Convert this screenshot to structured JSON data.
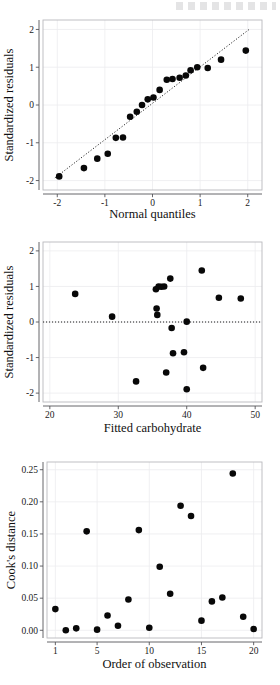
{
  "page": {
    "background": "#ffffff",
    "point_color": "#080808",
    "axis_color": "#555559",
    "grid_color": "#ececef",
    "panel_border_color": "#b9b9bd"
  },
  "chart_data": [
    {
      "id": "qq-plot",
      "type": "scatter",
      "title": "",
      "xlabel": "Normal quantiles",
      "ylabel": "Standardized residuals",
      "xlim": [
        -2.3,
        2.3
      ],
      "ylim": [
        -2.25,
        2.25
      ],
      "xticks": [
        -2,
        -1,
        0,
        1,
        2
      ],
      "xticklabels": [
        "-2",
        "-1",
        "0",
        "1",
        "2"
      ],
      "yticks": [
        -2,
        -1,
        0,
        1,
        2
      ],
      "yticklabels": [
        "-2",
        "-1",
        "0",
        "1",
        "2"
      ],
      "grid": true,
      "legend": "none",
      "reference_line": {
        "style": "dotted",
        "type": "qq-diagonal",
        "x": [
          -2.05,
          2.05
        ],
        "y": [
          -1.93,
          2.02
        ]
      },
      "x": [
        -1.96,
        -1.44,
        -1.16,
        -0.94,
        -0.77,
        -0.62,
        -0.47,
        -0.35,
        -0.25,
        -0.15,
        -0.05,
        0.05,
        0.15,
        0.25,
        0.35,
        0.47,
        0.62,
        0.77,
        0.94,
        1.16,
        1.44,
        1.96
      ],
      "y": [
        -1.89,
        -1.67,
        -1.42,
        -1.29,
        -0.87,
        -0.86,
        -0.31,
        -0.18,
        0.0,
        0.15,
        0.2,
        0.4,
        0.67,
        0.69,
        0.72,
        0.78,
        0.92,
        1.0,
        0.98,
        1.0,
        1.2,
        1.44
      ],
      "points": [
        {
          "x": -1.96,
          "y": -1.89
        },
        {
          "x": -1.44,
          "y": -1.67
        },
        {
          "x": -1.16,
          "y": -1.42
        },
        {
          "x": -0.94,
          "y": -1.29
        },
        {
          "x": -0.77,
          "y": -0.87
        },
        {
          "x": -0.62,
          "y": -0.86
        },
        {
          "x": -0.47,
          "y": -0.31
        },
        {
          "x": -0.33,
          "y": -0.18
        },
        {
          "x": -0.22,
          "y": 0.0
        },
        {
          "x": -0.1,
          "y": 0.15
        },
        {
          "x": 0.02,
          "y": 0.2
        },
        {
          "x": 0.15,
          "y": 0.4
        },
        {
          "x": 0.3,
          "y": 0.67
        },
        {
          "x": 0.42,
          "y": 0.69
        },
        {
          "x": 0.57,
          "y": 0.72
        },
        {
          "x": 0.7,
          "y": 0.78
        },
        {
          "x": 0.8,
          "y": 0.92
        },
        {
          "x": 0.94,
          "y": 1.0
        },
        {
          "x": 1.16,
          "y": 0.98
        },
        {
          "x": 1.44,
          "y": 1.2
        },
        {
          "x": 1.96,
          "y": 1.44
        }
      ]
    },
    {
      "id": "residuals-vs-fitted",
      "type": "scatter",
      "title": "",
      "xlabel": "Fitted carbohydrate",
      "ylabel": "Standardized residuals",
      "xlim": [
        19.0,
        51.0
      ],
      "ylim": [
        -2.25,
        2.25
      ],
      "xticks": [
        20,
        30,
        40,
        50
      ],
      "xticklabels": [
        "20",
        "30",
        "40",
        "50"
      ],
      "yticks": [
        -2,
        -1,
        0,
        1,
        2
      ],
      "yticklabels": [
        "-2",
        "-1",
        "0",
        "1",
        "2"
      ],
      "grid": true,
      "legend": "none",
      "reference_line": {
        "style": "dotted",
        "type": "horizontal",
        "y": 0
      },
      "x": [
        23.7,
        29.1,
        32.6,
        35.5,
        35.7,
        35.8,
        35.8,
        36.2,
        36.6,
        37.0,
        37.2,
        37.6,
        38.0,
        39.2,
        39.9,
        40.0,
        40.4,
        42.2,
        42.4,
        44.7,
        47.9
      ],
      "y": [
        0.79,
        0.15,
        -1.67,
        0.92,
        0.38,
        0.2,
        1.0,
        0.99,
        1.0,
        -1.42,
        1.22,
        -0.17,
        -0.88,
        -0.85,
        -1.89,
        0.01,
        -0.85,
        1.45,
        -1.29,
        0.68,
        0.66
      ],
      "points": [
        {
          "x": 23.7,
          "y": 0.79
        },
        {
          "x": 29.1,
          "y": 0.15
        },
        {
          "x": 32.6,
          "y": -1.67
        },
        {
          "x": 35.5,
          "y": 0.92
        },
        {
          "x": 35.6,
          "y": 0.38
        },
        {
          "x": 35.7,
          "y": 0.2
        },
        {
          "x": 35.9,
          "y": 1.0
        },
        {
          "x": 36.3,
          "y": 0.99
        },
        {
          "x": 36.7,
          "y": 1.0
        },
        {
          "x": 37.0,
          "y": -1.42
        },
        {
          "x": 37.6,
          "y": 1.22
        },
        {
          "x": 37.8,
          "y": -0.17
        },
        {
          "x": 38.0,
          "y": -0.88
        },
        {
          "x": 39.6,
          "y": -0.85
        },
        {
          "x": 40.0,
          "y": -1.89
        },
        {
          "x": 40.0,
          "y": 0.01
        },
        {
          "x": 42.2,
          "y": 1.45
        },
        {
          "x": 42.4,
          "y": -1.29
        },
        {
          "x": 44.7,
          "y": 0.68
        },
        {
          "x": 47.9,
          "y": 0.66
        }
      ]
    },
    {
      "id": "cooks-distance",
      "type": "scatter",
      "title": "",
      "xlabel": "Order of observation",
      "ylabel": "Cook's distance",
      "xlim": [
        0.2,
        20.8
      ],
      "ylim": [
        -0.012,
        0.262
      ],
      "xticks": [
        1,
        5,
        10,
        15,
        20
      ],
      "xticklabels": [
        "1",
        "5",
        "10",
        "15",
        "20"
      ],
      "yticks": [
        0.0,
        0.05,
        0.1,
        0.15,
        0.2,
        0.25
      ],
      "yticklabels": [
        "0.00",
        "0.05",
        "0.10",
        "0.15",
        "0.20",
        "0.25"
      ],
      "grid": true,
      "legend": "none",
      "reference_line": null,
      "x": [
        1,
        2,
        3,
        4,
        5,
        6,
        7,
        8,
        9,
        10,
        11,
        12,
        13,
        14,
        15,
        16,
        17,
        18,
        19,
        20
      ],
      "y": [
        0.033,
        0.0,
        0.003,
        0.154,
        0.001,
        0.023,
        0.007,
        0.048,
        0.156,
        0.004,
        0.099,
        0.057,
        0.194,
        0.178,
        0.015,
        0.045,
        0.051,
        0.244,
        0.021,
        0.002
      ],
      "points": [
        {
          "x": 1,
          "y": 0.033
        },
        {
          "x": 2,
          "y": 0.0
        },
        {
          "x": 3,
          "y": 0.003
        },
        {
          "x": 4,
          "y": 0.154
        },
        {
          "x": 5,
          "y": 0.001
        },
        {
          "x": 6,
          "y": 0.023
        },
        {
          "x": 7,
          "y": 0.007
        },
        {
          "x": 8,
          "y": 0.048
        },
        {
          "x": 9,
          "y": 0.156
        },
        {
          "x": 10,
          "y": 0.004
        },
        {
          "x": 11,
          "y": 0.099
        },
        {
          "x": 12,
          "y": 0.057
        },
        {
          "x": 13,
          "y": 0.194
        },
        {
          "x": 14,
          "y": 0.178
        },
        {
          "x": 15,
          "y": 0.015
        },
        {
          "x": 16,
          "y": 0.045
        },
        {
          "x": 17,
          "y": 0.051
        },
        {
          "x": 18,
          "y": 0.244
        },
        {
          "x": 19,
          "y": 0.021
        },
        {
          "x": 20,
          "y": 0.002
        }
      ]
    }
  ]
}
